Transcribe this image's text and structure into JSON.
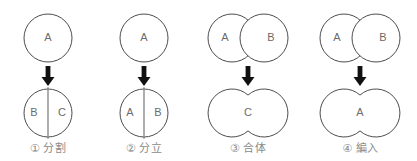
{
  "diagram": {
    "title": "",
    "colors": {
      "outline": "#4d4d4d",
      "divider": "#808080",
      "arrow": "#111111",
      "label_text": "#6b6b6b",
      "caption_text": "#8a8a8a",
      "background": "#ffffff"
    },
    "panels": [
      {
        "id": "1",
        "caption_number": "①",
        "caption_label": "分割",
        "before": {
          "shape": "single-circle",
          "labels": [
            "A"
          ]
        },
        "arrow": "down-arrow",
        "after": {
          "shape": "single-circle-divided",
          "labels": [
            "B",
            "C"
          ]
        }
      },
      {
        "id": "2",
        "caption_number": "②",
        "caption_label": "分立",
        "before": {
          "shape": "single-circle",
          "labels": [
            "A"
          ]
        },
        "arrow": "down-arrow",
        "after": {
          "shape": "single-circle-divided",
          "labels": [
            "A",
            "B"
          ]
        }
      },
      {
        "id": "3",
        "caption_number": "③",
        "caption_label": "合体",
        "before": {
          "shape": "two-overlapping-circles",
          "labels": [
            "A",
            "B"
          ]
        },
        "arrow": "down-arrow",
        "after": {
          "shape": "merged-union",
          "labels": [
            "C"
          ]
        }
      },
      {
        "id": "4",
        "caption_number": "④",
        "caption_label": "編入",
        "before": {
          "shape": "two-overlapping-circles",
          "labels": [
            "A",
            "B"
          ]
        },
        "arrow": "down-arrow",
        "after": {
          "shape": "merged-union",
          "labels": [
            "A"
          ]
        }
      }
    ]
  }
}
